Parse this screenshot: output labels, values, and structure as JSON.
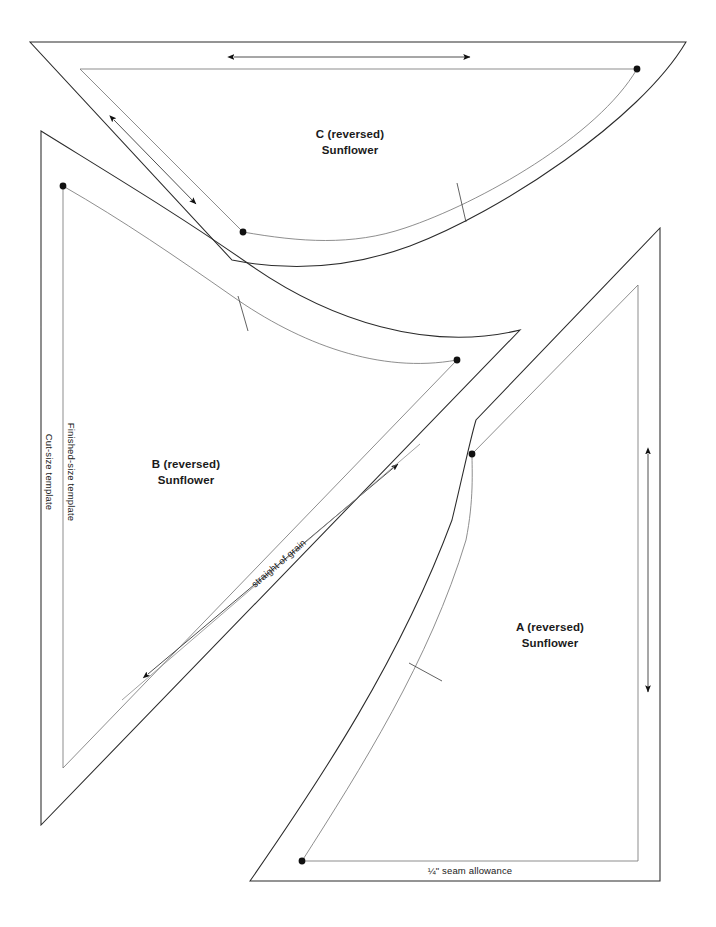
{
  "document": {
    "type": "quilt-pattern-template-sheet",
    "background_color": "#ffffff",
    "ink_color": "#2b2b2b",
    "finished_line_color": "#7a7a7a",
    "width": 716,
    "height": 927
  },
  "pieces": [
    {
      "id": "c",
      "label_line1": "C (reversed)",
      "label_line2": "Sunflower",
      "label_x": 350,
      "label_y": 134
    },
    {
      "id": "b",
      "label_line1": "B (reversed)",
      "label_line2": "Sunflower",
      "label_x": 186,
      "label_y": 464
    },
    {
      "id": "a",
      "label_line1": "A (reversed)",
      "label_line2": "Sunflower",
      "label_x": 550,
      "label_y": 627
    }
  ],
  "annotations": {
    "cut_size_template": "Cut-size template",
    "finished_size_template": "Finished-size template",
    "straight_of_grain": "straight of grain",
    "seam_allowance": "¼\" seam allowance"
  },
  "grain_arrows": [
    {
      "name": "grain-arrow-c-horizontal",
      "orientation": "horizontal",
      "x1": 232,
      "y1": 57,
      "x2": 472,
      "y2": 57
    },
    {
      "name": "grain-arrow-c-diagonal",
      "orientation": "diagonal",
      "x1": 112,
      "y1": 118,
      "x2": 198,
      "y2": 206
    },
    {
      "name": "grain-arrow-b-diagonal",
      "orientation": "diagonal",
      "x1": 146,
      "y1": 676,
      "x2": 400,
      "y2": 462
    },
    {
      "name": "grain-arrow-a-vertical",
      "orientation": "vertical",
      "x1": 648,
      "y1": 452,
      "x2": 648,
      "y2": 694
    }
  ],
  "registration_dots": [
    {
      "name": "dot-c-right",
      "x": 637,
      "y": 69
    },
    {
      "name": "dot-c-inner-corner",
      "x": 243,
      "y": 232
    },
    {
      "name": "dot-b-top",
      "x": 63,
      "y": 186
    },
    {
      "name": "dot-b-curve-end",
      "x": 457,
      "y": 360
    },
    {
      "name": "dot-a-top",
      "x": 472,
      "y": 454
    },
    {
      "name": "dot-a-bottom",
      "x": 302,
      "y": 861
    }
  ],
  "notches": [
    {
      "name": "notch-c",
      "x1": 457,
      "y1": 183,
      "x2": 466,
      "y2": 222
    },
    {
      "name": "notch-b",
      "x1": 238,
      "y1": 296,
      "x2": 248,
      "y2": 331
    },
    {
      "name": "notch-a",
      "x1": 409,
      "y1": 663,
      "x2": 442,
      "y2": 681
    }
  ]
}
